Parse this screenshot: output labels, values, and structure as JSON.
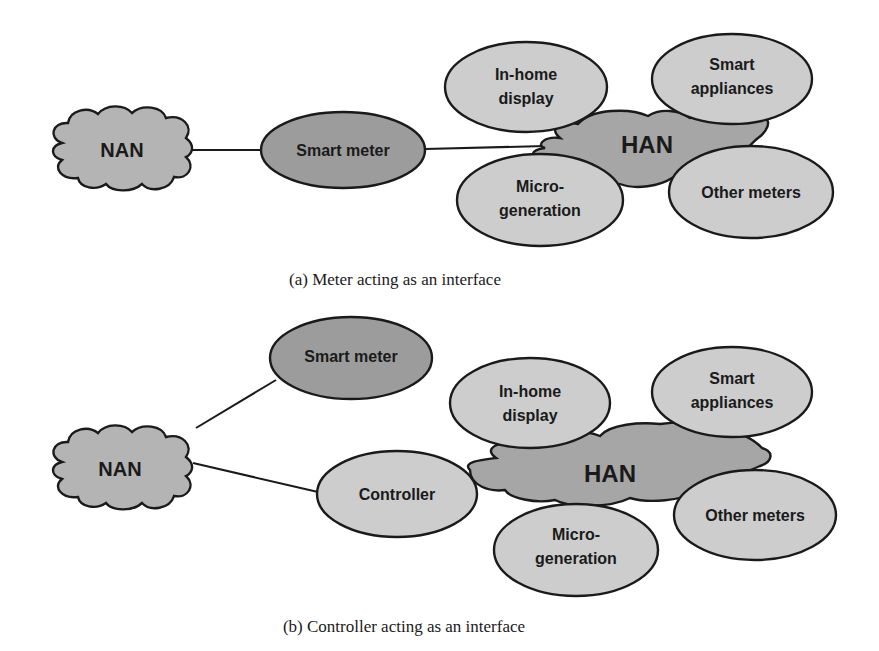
{
  "colors": {
    "background": "#ffffff",
    "stroke": "#1a1a1a",
    "cloud_fill": "#b4b4b4",
    "smart_meter_fill": "#9c9c9c",
    "device_fill": "#cdcdcd",
    "han_fill": "#a6a6a6"
  },
  "diagram_a": {
    "nan": "NAN",
    "smart_meter": "Smart meter",
    "han": "HAN",
    "in_home_display": [
      "In-home",
      "display"
    ],
    "smart_appliances": [
      "Smart",
      "appliances"
    ],
    "micro_generation": [
      "Micro-",
      "generation"
    ],
    "other_meters": "Other meters",
    "caption": "(a) Meter acting as an interface"
  },
  "diagram_b": {
    "nan": "NAN",
    "smart_meter": "Smart meter",
    "controller": "Controller",
    "han": "HAN",
    "in_home_display": [
      "In-home",
      "display"
    ],
    "smart_appliances": [
      "Smart",
      "appliances"
    ],
    "micro_generation": [
      "Micro-",
      "generation"
    ],
    "other_meters": "Other meters",
    "caption": "(b) Controller acting as an interface"
  }
}
